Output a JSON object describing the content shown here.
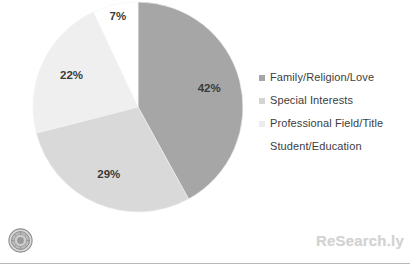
{
  "chart_data": {
    "type": "pie",
    "title": "",
    "subtitle": "",
    "xlabel": "",
    "ylabel": "",
    "grid": false,
    "legend_position": "right",
    "start_angle_clock": "12 o'clock",
    "direction": "clockwise",
    "units": "percent",
    "categories": [
      "Family/Religion/Love",
      "Special Interests",
      "Professional Field/Title",
      "Student/Education"
    ],
    "values": [
      42,
      29,
      22,
      7
    ],
    "data_labels": [
      "42%",
      "29%",
      "22%",
      "7%"
    ],
    "colors": [
      "#a6a6a6",
      "#d9d9d9",
      "#efefef",
      "#ffffff"
    ],
    "slices": [
      {
        "label": "Family/Religion/Love",
        "value": 42,
        "data_label": "42%",
        "color": "#a6a6a6"
      },
      {
        "label": "Special Interests",
        "value": 29,
        "data_label": "29%",
        "color": "#d9d9d9"
      },
      {
        "label": "Professional Field/Title",
        "value": 22,
        "data_label": "22%",
        "color": "#efefef"
      },
      {
        "label": "Student/Education",
        "value": 7,
        "data_label": "7%",
        "color": "#ffffff"
      }
    ]
  },
  "legend": {
    "items": [
      {
        "label": "Family/Religion/Love",
        "color": "#a6a6a6"
      },
      {
        "label": "Special Interests",
        "color": "#d4d4d4"
      },
      {
        "label": "Professional Field/Title",
        "color": "#ececec"
      },
      {
        "label": "Student/Education",
        "color": "#ffffff"
      }
    ]
  },
  "footer": {
    "seal_name": "university-seal",
    "watermark": "ReSearch.ly"
  }
}
